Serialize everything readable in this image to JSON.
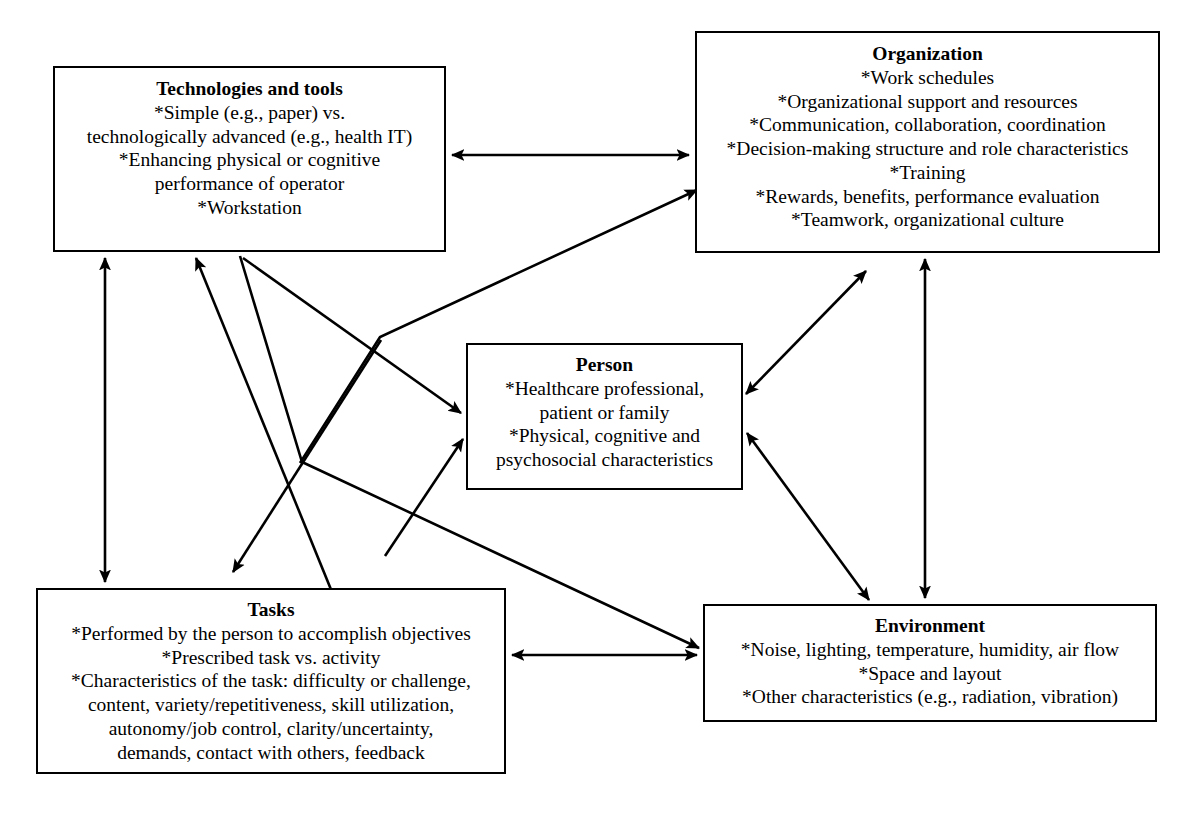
{
  "diagram": {
    "line_color": "#000000",
    "box_border_color": "#000000",
    "background_color": "#ffffff"
  },
  "nodes": {
    "technologies": {
      "title": "Technologies and tools",
      "lines": [
        "*Simple (e.g., paper) vs.",
        "technologically advanced (e.g., health IT)",
        "*Enhancing physical or cognitive",
        "performance of operator",
        "*Workstation"
      ]
    },
    "organization": {
      "title": "Organization",
      "lines": [
        "*Work schedules",
        "*Organizational support and resources",
        "*Communication, collaboration, coordination",
        "*Decision-making structure and role characteristics",
        "*Training",
        "*Rewards, benefits, performance evaluation",
        "*Teamwork, organizational culture"
      ]
    },
    "person": {
      "title": "Person",
      "lines": [
        "*Healthcare professional,",
        "patient or family",
        "*Physical, cognitive and",
        "psychosocial characteristics"
      ]
    },
    "tasks": {
      "title": "Tasks",
      "lines": [
        "*Performed by the person to accomplish objectives",
        "*Prescribed task vs. activity",
        "*Characteristics of the task: difficulty or challenge,",
        "content, variety/repetitiveness, skill utilization,",
        "autonomy/job control, clarity/uncertainty,",
        "demands, contact with others, feedback"
      ]
    },
    "environment": {
      "title": "Environment",
      "lines": [
        "*Noise, lighting, temperature, humidity, air flow",
        "*Space and layout",
        "*Other characteristics (e.g., radiation, vibration)"
      ]
    }
  },
  "connections": [
    {
      "id": "technologies-organization",
      "from": "technologies",
      "to": "organization",
      "direction": "both"
    },
    {
      "id": "technologies-tasks",
      "from": "technologies",
      "to": "tasks",
      "direction": "both"
    },
    {
      "id": "technologies-person",
      "from": "technologies",
      "to": "person",
      "direction": "to"
    },
    {
      "id": "tasks-technologies",
      "from": "tasks",
      "to": "technologies",
      "direction": "to"
    },
    {
      "id": "tasks-person",
      "from": "tasks",
      "to": "person",
      "direction": "to"
    },
    {
      "id": "technologies-environment",
      "from": "technologies",
      "to": "environment",
      "direction": "to"
    },
    {
      "id": "person-organization-bend",
      "from": "person",
      "to": "organization",
      "direction": "to"
    },
    {
      "id": "organization-tasks",
      "from": "organization",
      "to": "tasks",
      "direction": "to"
    },
    {
      "id": "person-organization",
      "from": "person",
      "to": "organization",
      "direction": "both"
    },
    {
      "id": "organization-environment",
      "from": "organization",
      "to": "environment",
      "direction": "both"
    },
    {
      "id": "person-environment",
      "from": "person",
      "to": "environment",
      "direction": "both"
    },
    {
      "id": "tasks-environment",
      "from": "tasks",
      "to": "environment",
      "direction": "both"
    }
  ]
}
